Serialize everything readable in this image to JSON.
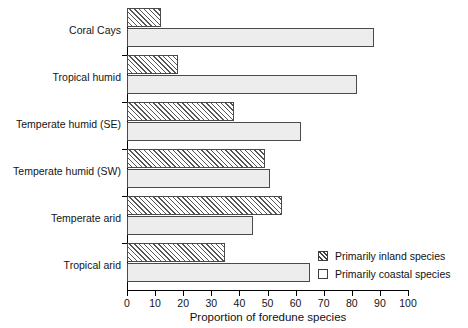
{
  "chart_data": {
    "type": "bar",
    "orientation": "horizontal",
    "title": "",
    "xlabel": "Proportion of foredune species",
    "ylabel": "",
    "xlim": [
      0,
      100
    ],
    "xticks": [
      0,
      10,
      20,
      30,
      40,
      50,
      60,
      70,
      80,
      90,
      100
    ],
    "xtick_labels": [
      "0",
      "10",
      "20",
      "30",
      "40",
      "50",
      "60",
      "70",
      "80",
      "90",
      "100"
    ],
    "grid": false,
    "legend_position": "bottom-right",
    "categories": [
      "Coral Cays",
      "Tropical humid",
      "Temperate humid (SE)",
      "Temperate humid (SW)",
      "Temperate arid",
      "Tropical arid"
    ],
    "series": [
      {
        "name": "Primarily inland species",
        "fill": "hatched",
        "values": [
          12,
          18,
          38,
          49,
          55,
          35
        ]
      },
      {
        "name": "Primarily coastal species",
        "fill": "light-gray",
        "values": [
          88,
          82,
          62,
          51,
          45,
          65
        ]
      }
    ]
  },
  "legend": {
    "items": [
      {
        "label": "Primarily inland species",
        "swatch": "hatched-square-icon"
      },
      {
        "label": "Primarily coastal species",
        "swatch": "empty-square-icon"
      }
    ]
  },
  "axis": {
    "x_title": "Proportion of foredune species"
  }
}
